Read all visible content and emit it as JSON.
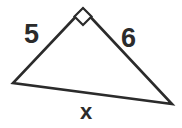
{
  "figure": {
    "kind": "right-triangle-diagram",
    "background_color": "#ffffff",
    "stroke_color": "#2b2b2b",
    "stroke_width": 2.6,
    "width": 182,
    "height": 128,
    "vertices": {
      "apex": {
        "x": 83,
        "y": 9
      },
      "left": {
        "x": 13,
        "y": 83
      },
      "right": {
        "x": 172,
        "y": 104
      }
    },
    "right_angle_marker": {
      "at_vertex": "apex",
      "shape": "square",
      "center_x": 83,
      "center_y": 16.5,
      "half_diagonal": 8.5,
      "stroke_color": "#2b2b2b",
      "stroke_width": 2.2
    },
    "labels": {
      "side_a": "5",
      "side_b": "6",
      "side_c": "x"
    },
    "label_roles": {
      "side_a": "left leg length",
      "side_b": "right leg length",
      "side_c": "hypotenuse unknown"
    }
  },
  "chart_data": {
    "type": "diagram",
    "title": "",
    "shape": "right triangle",
    "categories": [
      "5",
      "6",
      "x"
    ],
    "values": [
      5,
      6,
      null
    ],
    "annotations": [
      {
        "text": "5",
        "role": "leg",
        "x": 33,
        "y": 34
      },
      {
        "text": "6",
        "role": "leg",
        "x": 131,
        "y": 38
      },
      {
        "text": "x",
        "role": "hypotenuse",
        "x": 88,
        "y": 112
      },
      {
        "text": "right angle",
        "role": "angle-marker",
        "x": 83,
        "y": 16
      }
    ]
  }
}
